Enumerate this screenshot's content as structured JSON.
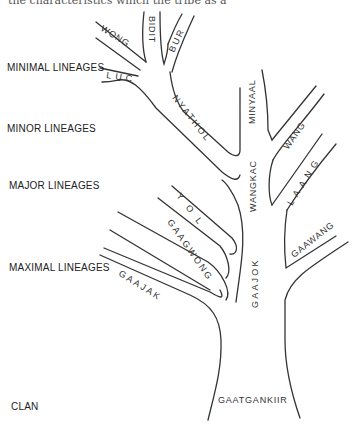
{
  "top_caption": "the characteristics which the tribe as a",
  "levels": [
    {
      "label": "MINIMAL LINEAGES"
    },
    {
      "label": "MINOR LINEAGES"
    },
    {
      "label": "MAJOR LINEAGES"
    },
    {
      "label": "MAXIMAL LINEAGES"
    },
    {
      "label": "CLAN"
    }
  ],
  "branches": {
    "clan": "GAATGANKIIR",
    "maximal": [
      "GAAJAK",
      "GAAJOK",
      "GAAWANG"
    ],
    "major": [
      "GAAGWONG",
      "YOL",
      "WANGKAC",
      "LAANG"
    ],
    "minor": [
      "NYATHOL",
      "MINYAAL",
      "WANG"
    ],
    "minimal": [
      "WONG",
      "BIDIT",
      "BUR",
      "LUC"
    ]
  }
}
